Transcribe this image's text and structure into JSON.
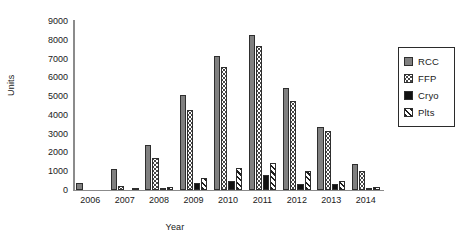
{
  "chart_data": {
    "type": "bar",
    "title": "",
    "xlabel": "Year",
    "ylabel": "Units",
    "categories": [
      "2006",
      "2007",
      "2008",
      "2009",
      "2010",
      "2011",
      "2012",
      "2013",
      "2014"
    ],
    "series": [
      {
        "name": "RCC",
        "values": [
          350,
          1100,
          2380,
          5050,
          7150,
          8250,
          5450,
          3380,
          1380
        ],
        "color": "#808080",
        "fill": "solid-gray"
      },
      {
        "name": "FFP",
        "values": [
          0,
          200,
          1720,
          4250,
          6550,
          7650,
          4750,
          3120,
          1000
        ],
        "color": "#ffffff",
        "fill": "dotted"
      },
      {
        "name": "Cryo",
        "values": [
          0,
          0,
          100,
          400,
          500,
          800,
          330,
          340,
          110
        ],
        "color": "#111111",
        "fill": "solid-black"
      },
      {
        "name": "Plts",
        "values": [
          0,
          50,
          150,
          650,
          1150,
          1420,
          1030,
          480,
          180
        ],
        "color": "#ffffff",
        "fill": "diagonal-hatch"
      }
    ],
    "ylim": [
      0,
      9000
    ],
    "yticks": [
      0,
      1000,
      2000,
      3000,
      4000,
      5000,
      6000,
      7000,
      8000,
      9000
    ],
    "ytick_labels": [
      "0",
      "1000",
      "2000",
      "3000",
      "4000",
      "5000",
      "6000",
      "7000",
      "8000",
      "9000"
    ],
    "grid": false,
    "legend_position": "right",
    "legend_entries": [
      "RCC",
      "FFP",
      "Cryo",
      "Plts"
    ],
    "background_color": "#ffffff",
    "axis_color": "#8b8b8b"
  }
}
